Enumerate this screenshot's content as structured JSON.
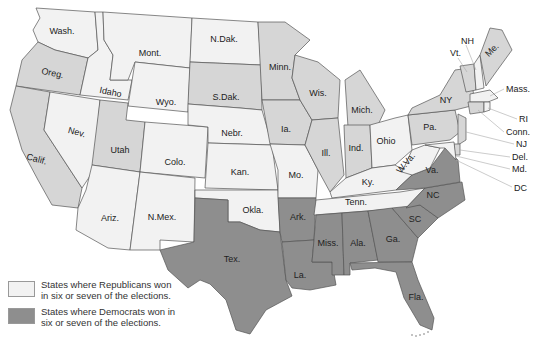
{
  "colors": {
    "republican": "#f2f2f2",
    "swing": "#d6d6d6",
    "democrat": "#8e8e8e",
    "border": "#555555"
  },
  "legend": [
    {
      "category": "republican",
      "label": "States where Republicans won in six or seven of the elections."
    },
    {
      "category": "democrat",
      "label": "States where Democrats won in six or seven of the elections."
    }
  ],
  "states": [
    {
      "name": "Wash.",
      "category": "republican"
    },
    {
      "name": "Oreg.",
      "category": "swing"
    },
    {
      "name": "Calif.",
      "category": "swing"
    },
    {
      "name": "Idaho",
      "category": "republican"
    },
    {
      "name": "Nev.",
      "category": "republican"
    },
    {
      "name": "Mont.",
      "category": "republican"
    },
    {
      "name": "Wyo.",
      "category": "republican"
    },
    {
      "name": "Utah",
      "category": "swing"
    },
    {
      "name": "Colo.",
      "category": "republican"
    },
    {
      "name": "Ariz.",
      "category": "republican"
    },
    {
      "name": "N.Mex.",
      "category": "republican"
    },
    {
      "name": "N.Dak.",
      "category": "republican"
    },
    {
      "name": "S.Dak.",
      "category": "swing"
    },
    {
      "name": "Nebr.",
      "category": "republican"
    },
    {
      "name": "Kan.",
      "category": "republican"
    },
    {
      "name": "Okla.",
      "category": "republican"
    },
    {
      "name": "Tex.",
      "category": "democrat"
    },
    {
      "name": "Minn.",
      "category": "swing"
    },
    {
      "name": "Ia.",
      "category": "swing"
    },
    {
      "name": "Mo.",
      "category": "republican"
    },
    {
      "name": "Ark.",
      "category": "democrat"
    },
    {
      "name": "La.",
      "category": "democrat"
    },
    {
      "name": "Wis.",
      "category": "swing"
    },
    {
      "name": "Ill.",
      "category": "swing"
    },
    {
      "name": "Mich.",
      "category": "swing"
    },
    {
      "name": "Ind.",
      "category": "swing"
    },
    {
      "name": "Ohio",
      "category": "republican"
    },
    {
      "name": "Ky.",
      "category": "republican"
    },
    {
      "name": "Tenn.",
      "category": "republican"
    },
    {
      "name": "Miss.",
      "category": "democrat"
    },
    {
      "name": "Ala.",
      "category": "democrat"
    },
    {
      "name": "Ga.",
      "category": "democrat"
    },
    {
      "name": "Fla.",
      "category": "democrat"
    },
    {
      "name": "SC",
      "category": "democrat"
    },
    {
      "name": "NC",
      "category": "democrat"
    },
    {
      "name": "Va.",
      "category": "democrat"
    },
    {
      "name": "W.Va.",
      "category": "republican"
    },
    {
      "name": "Pa.",
      "category": "swing"
    },
    {
      "name": "NY",
      "category": "swing"
    },
    {
      "name": "Vt.",
      "category": "swing"
    },
    {
      "name": "NH",
      "category": "republican"
    },
    {
      "name": "Me.",
      "category": "swing"
    },
    {
      "name": "Mass.",
      "category": "republican"
    },
    {
      "name": "RI",
      "category": "republican"
    },
    {
      "name": "Conn.",
      "category": "swing"
    },
    {
      "name": "NJ",
      "category": "swing"
    },
    {
      "name": "Del.",
      "category": "swing"
    },
    {
      "name": "Md.",
      "category": "republican"
    },
    {
      "name": "DC",
      "category": "republican"
    }
  ]
}
